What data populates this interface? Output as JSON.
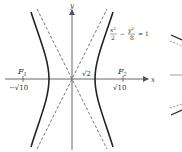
{
  "diagram": {
    "type": "hyperbola",
    "equation": {
      "x_term_num": "x²",
      "x_term_den": "2",
      "minus": "−",
      "y_term_num": "y²",
      "y_term_den": "8",
      "rhs": "= 1"
    },
    "axes": {
      "x_label": "x",
      "y_label": "y"
    },
    "foci": [
      {
        "name": "F",
        "sub": "1",
        "coord_label": "−√10"
      },
      {
        "name": "F",
        "sub": "2",
        "coord_label": "√10"
      }
    ],
    "vertex_label": "√2",
    "asymptotes": [
      "y = 2x",
      "y = −2x"
    ],
    "colors": {
      "curve": "#222222",
      "axis": "#555555",
      "asymptote": "#666666"
    }
  }
}
